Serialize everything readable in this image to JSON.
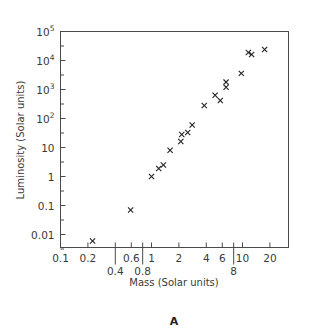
{
  "chart_data": {
    "type": "scatter",
    "title": "",
    "panel_label": "A",
    "xlabel": "Mass (Solar units)",
    "ylabel": "Luminosity (Solar units)",
    "xscale": "log",
    "yscale": "log",
    "xlim": [
      0.1,
      33
    ],
    "ylim": [
      0.0035,
      100000
    ],
    "grid": false,
    "legend": null,
    "marker": "x",
    "x_ticks_upper": [
      {
        "value": 0.1,
        "label": "0.1"
      },
      {
        "value": 0.2,
        "label": "0.2"
      },
      {
        "value": 0.6,
        "label": "0.6"
      },
      {
        "value": 1,
        "label": "1"
      },
      {
        "value": 2,
        "label": "2"
      },
      {
        "value": 4,
        "label": "4"
      },
      {
        "value": 6,
        "label": "6"
      },
      {
        "value": 10,
        "label": "10"
      },
      {
        "value": 20,
        "label": "20"
      }
    ],
    "x_ticks_lower": [
      {
        "value": 0.4,
        "label": "0.4"
      },
      {
        "value": 0.8,
        "label": "0.8"
      },
      {
        "value": 8,
        "label": "8"
      }
    ],
    "y_ticks": [
      {
        "value": 0.01,
        "label": "0.01"
      },
      {
        "value": 0.1,
        "label": "0.1"
      },
      {
        "value": 1,
        "label": "1"
      },
      {
        "value": 10,
        "label": "10"
      },
      {
        "value": 100,
        "label": "10",
        "exp": "2"
      },
      {
        "value": 1000,
        "label": "10",
        "exp": "3"
      },
      {
        "value": 10000,
        "label": "10",
        "exp": "4"
      },
      {
        "value": 100000,
        "label": "10",
        "exp": "5"
      }
    ],
    "points": [
      {
        "mass": 0.225,
        "luminosity": 0.006
      },
      {
        "mass": 0.59,
        "luminosity": 0.07
      },
      {
        "mass": 1.0,
        "luminosity": 1.0
      },
      {
        "mass": 1.2,
        "luminosity": 1.9
      },
      {
        "mass": 1.35,
        "luminosity": 2.5
      },
      {
        "mass": 1.6,
        "luminosity": 8
      },
      {
        "mass": 2.1,
        "luminosity": 16
      },
      {
        "mass": 2.15,
        "luminosity": 28
      },
      {
        "mass": 2.5,
        "luminosity": 33
      },
      {
        "mass": 2.8,
        "luminosity": 60
      },
      {
        "mass": 3.8,
        "luminosity": 280
      },
      {
        "mass": 5.0,
        "luminosity": 630
      },
      {
        "mass": 5.7,
        "luminosity": 420
      },
      {
        "mass": 6.6,
        "luminosity": 1200
      },
      {
        "mass": 6.6,
        "luminosity": 1800
      },
      {
        "mass": 9.7,
        "luminosity": 3600
      },
      {
        "mass": 11.6,
        "luminosity": 19000
      },
      {
        "mass": 12.6,
        "luminosity": 16000
      },
      {
        "mass": 17.5,
        "luminosity": 24000
      }
    ]
  }
}
